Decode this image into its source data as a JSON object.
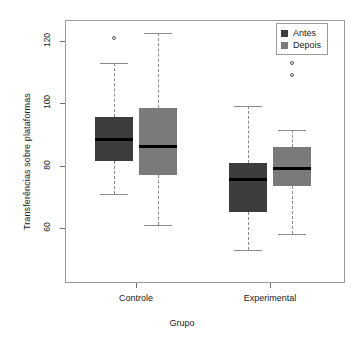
{
  "chart_data": {
    "type": "box",
    "title": "",
    "xlabel": "Grupo",
    "ylabel": "Transferências sobre plataformas",
    "categories": [
      "Controle",
      "Experimental"
    ],
    "ylim": [
      50,
      126
    ],
    "yticks": [
      60,
      80,
      100,
      120
    ],
    "ytick_labels": [
      "60",
      "80",
      "100",
      "120"
    ],
    "grid": false,
    "legend_position": "top-right",
    "series": [
      {
        "name": "Antes",
        "color": "#3d3d3d",
        "boxes": [
          {
            "category": "Controle",
            "min_whisker": 71,
            "q1": 81.5,
            "median": 88.5,
            "q3": 95.5,
            "max_whisker": 113,
            "outliers": [
              121
            ]
          },
          {
            "category": "Experimental",
            "min_whisker": 53,
            "q1": 65,
            "median": 75.5,
            "q3": 81,
            "max_whisker": 99,
            "outliers": []
          }
        ]
      },
      {
        "name": "Depois",
        "color": "#7a7a7a",
        "boxes": [
          {
            "category": "Controle",
            "min_whisker": 61,
            "q1": 77,
            "median": 86,
            "q3": 98.5,
            "max_whisker": 122.5,
            "outliers": []
          },
          {
            "category": "Experimental",
            "min_whisker": 58,
            "q1": 73.5,
            "median": 79,
            "q3": 86,
            "max_whisker": 91.5,
            "outliers": [
              113,
              109
            ]
          }
        ]
      }
    ]
  },
  "legend": {
    "items": [
      {
        "label": "Antes",
        "color": "#3d3d3d"
      },
      {
        "label": "Depois",
        "color": "#7a7a7a"
      }
    ]
  },
  "axes": {
    "y_title": "Transferências sobre plataformas",
    "x_title": "Grupo",
    "x_tick_labels": [
      "Controle",
      "Experimental"
    ],
    "y_tick_labels": [
      "60",
      "80",
      "100",
      "120"
    ]
  }
}
